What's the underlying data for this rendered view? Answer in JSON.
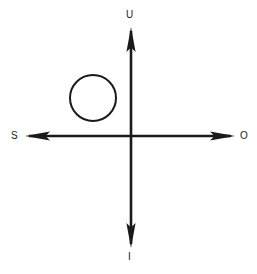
{
  "diagram": {
    "background_color": "#ffffff",
    "stroke_color": "#1a1a1a",
    "width": 257,
    "height": 274,
    "origin": {
      "x": 131,
      "y": 136
    },
    "axes": [
      {
        "id": "vertical-axis",
        "orientation": "vertical",
        "x": 131,
        "from_y": 28,
        "to_y": 247,
        "arrowheads": [
          "up",
          "down"
        ]
      },
      {
        "id": "horizontal-axis",
        "orientation": "horizontal",
        "y": 136,
        "from_x": 26,
        "to_x": 234,
        "arrowheads": [
          "left",
          "right"
        ]
      }
    ],
    "labels": {
      "up": "U",
      "right": "O",
      "down": "I",
      "left": "S"
    },
    "shapes": [
      {
        "id": "circle",
        "type": "circle",
        "center_x": 93,
        "center_y": 98,
        "radius": 23,
        "fill": "none",
        "stroke": "#1a1a1a",
        "stroke_width": 2,
        "quadrant": "upper-left"
      }
    ]
  }
}
